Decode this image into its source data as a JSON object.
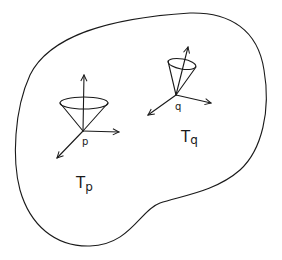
{
  "diagram": {
    "region": {
      "name": "manifold"
    },
    "points": [
      {
        "id": "p",
        "label": "p",
        "tangent_space_label": "T",
        "tangent_space_subscript": "p"
      },
      {
        "id": "q",
        "label": "q",
        "tangent_space_label": "T",
        "tangent_space_subscript": "q"
      }
    ],
    "colors": {
      "stroke": "#1a1a1a",
      "background": "#ffffff"
    }
  }
}
